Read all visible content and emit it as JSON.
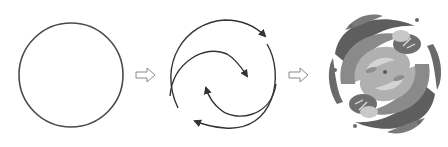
{
  "diagram": {
    "type": "process-sequence",
    "steps": [
      {
        "id": "step-1",
        "shape": "plain-circle",
        "stroke": "#444444"
      },
      {
        "id": "step-2",
        "shape": "circle-with-swirling-arrows",
        "stroke": "#333333"
      },
      {
        "id": "step-3",
        "shape": "decorative-floral-swirl-emblem",
        "palette": [
          "#5a5a5a",
          "#7a7a7a",
          "#9a9a9a",
          "#b8b8b8",
          "#d0d0d0"
        ]
      }
    ],
    "connectors": [
      {
        "from": "step-1",
        "to": "step-2",
        "icon": "hollow-right-arrow",
        "stroke": "#8a8a8a"
      },
      {
        "from": "step-2",
        "to": "step-3",
        "icon": "hollow-right-arrow",
        "stroke": "#8a8a8a"
      }
    ]
  }
}
